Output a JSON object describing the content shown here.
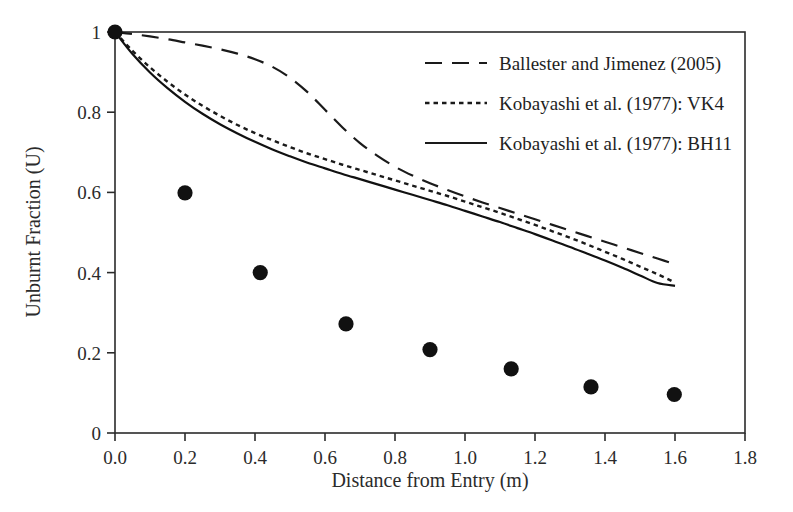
{
  "chart_data": {
    "type": "line",
    "title": "",
    "xlabel": "Distance from Entry (m)",
    "ylabel": "Unburnt Fraction (U)",
    "xlim": [
      0.0,
      1.8
    ],
    "ylim": [
      0.0,
      1.0
    ],
    "xticks": [
      "0.0",
      "0.2",
      "0.4",
      "0.6",
      "0.8",
      "1.0",
      "1.2",
      "1.4",
      "1.6",
      "1.8"
    ],
    "xtick_values": [
      0.0,
      0.2,
      0.4,
      0.6,
      0.8,
      1.0,
      1.2,
      1.4,
      1.6,
      1.8
    ],
    "yticks": [
      "0",
      "0.2",
      "0.4",
      "0.6",
      "0.8",
      "1"
    ],
    "ytick_values": [
      0.0,
      0.2,
      0.4,
      0.6,
      0.8,
      1.0
    ],
    "grid": false,
    "legend_position": "top-right",
    "series": [
      {
        "name": "Ballester and Jimenez (2005)",
        "style": "dashed",
        "color": "#1a1a1a",
        "x": [
          0.0,
          0.05,
          0.1,
          0.15,
          0.2,
          0.25,
          0.3,
          0.35,
          0.4,
          0.45,
          0.5,
          0.55,
          0.6,
          0.65,
          0.7,
          0.75,
          0.8,
          0.85,
          0.9,
          0.95,
          1.0,
          1.05,
          1.1,
          1.15,
          1.2,
          1.25,
          1.3,
          1.35,
          1.4,
          1.45,
          1.5,
          1.55,
          1.6
        ],
        "y": [
          1.0,
          0.995,
          0.989,
          0.982,
          0.974,
          0.966,
          0.957,
          0.946,
          0.932,
          0.913,
          0.886,
          0.85,
          0.806,
          0.762,
          0.723,
          0.691,
          0.664,
          0.642,
          0.623,
          0.606,
          0.59,
          0.575,
          0.561,
          0.547,
          0.533,
          0.519,
          0.505,
          0.491,
          0.477,
          0.463,
          0.449,
          0.435,
          0.421
        ]
      },
      {
        "name": "Kobayashi et al. (1977): VK4",
        "style": "dotted",
        "color": "#1a1a1a",
        "x": [
          0.0,
          0.05,
          0.1,
          0.15,
          0.2,
          0.25,
          0.3,
          0.35,
          0.4,
          0.45,
          0.5,
          0.55,
          0.6,
          0.65,
          0.7,
          0.75,
          0.8,
          0.85,
          0.9,
          0.95,
          1.0,
          1.05,
          1.1,
          1.15,
          1.2,
          1.25,
          1.3,
          1.35,
          1.4,
          1.45,
          1.5,
          1.55,
          1.6
        ],
        "y": [
          1.0,
          0.953,
          0.912,
          0.876,
          0.844,
          0.816,
          0.791,
          0.768,
          0.748,
          0.73,
          0.713,
          0.697,
          0.683,
          0.669,
          0.656,
          0.643,
          0.63,
          0.617,
          0.604,
          0.591,
          0.577,
          0.563,
          0.549,
          0.534,
          0.519,
          0.503,
          0.487,
          0.47,
          0.452,
          0.434,
          0.415,
          0.396,
          0.375
        ]
      },
      {
        "name": "Kobayashi et al. (1977): BH11",
        "style": "solid",
        "color": "#111111",
        "x": [
          0.0,
          0.05,
          0.1,
          0.15,
          0.2,
          0.25,
          0.3,
          0.35,
          0.4,
          0.45,
          0.5,
          0.55,
          0.6,
          0.65,
          0.7,
          0.75,
          0.8,
          0.85,
          0.9,
          0.95,
          1.0,
          1.05,
          1.1,
          1.15,
          1.2,
          1.25,
          1.3,
          1.35,
          1.4,
          1.45,
          1.5,
          1.55,
          1.6
        ],
        "y": [
          1.0,
          0.945,
          0.899,
          0.86,
          0.826,
          0.796,
          0.77,
          0.747,
          0.726,
          0.707,
          0.69,
          0.674,
          0.66,
          0.646,
          0.633,
          0.62,
          0.607,
          0.594,
          0.581,
          0.568,
          0.554,
          0.54,
          0.526,
          0.511,
          0.496,
          0.48,
          0.464,
          0.447,
          0.43,
          0.412,
          0.393,
          0.374,
          0.367
        ]
      }
    ],
    "scatter": {
      "name": "Experimental data",
      "marker": "filled-circle",
      "color": "#111111",
      "points": [
        {
          "x": 0.0,
          "y": 1.0
        },
        {
          "x": 0.2,
          "y": 0.599
        },
        {
          "x": 0.415,
          "y": 0.4
        },
        {
          "x": 0.66,
          "y": 0.272
        },
        {
          "x": 0.9,
          "y": 0.208
        },
        {
          "x": 1.132,
          "y": 0.16
        },
        {
          "x": 1.36,
          "y": 0.115
        },
        {
          "x": 1.598,
          "y": 0.096
        }
      ]
    }
  },
  "legend": {
    "entries": [
      {
        "label": "Ballester and Jimenez (2005)",
        "style": "dashed"
      },
      {
        "label": "Kobayashi et al. (1977): VK4",
        "style": "dotted"
      },
      {
        "label": "Kobayashi et al. (1977): BH11",
        "style": "solid"
      }
    ]
  }
}
